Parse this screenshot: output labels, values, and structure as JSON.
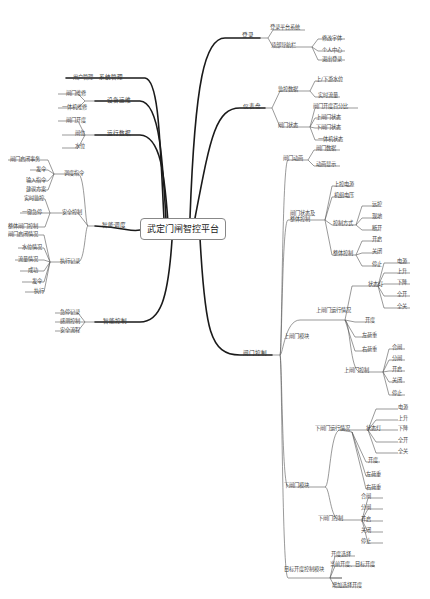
{
  "center": "武定门闸智控平台",
  "left": [
    {
      "label": "系统管理",
      "children": [
        "用户管理"
      ]
    },
    {
      "label": "设备运维",
      "children": [
        "闸门维修",
        "一体机维修"
      ]
    },
    {
      "label": "运行数据",
      "children": [
        "闸门开度",
        "闸位",
        "水位"
      ]
    },
    {
      "label": "智能调度",
      "children": [
        {
          "label": "调度指令",
          "children": [
            "闸门启闭事务",
            "发令",
            "输入指令",
            "建议方案"
          ]
        },
        {
          "label": "安全控制",
          "children": [
            "实时监控",
            "一键急停",
            "整体闸门控制"
          ]
        },
        {
          "label": "执行记录",
          "children": [
            "闸门启闭情况",
            "水位情况",
            "流量情况",
            "成功",
            "发令",
            "执行"
          ]
        }
      ]
    },
    {
      "label": "智能控制",
      "children": [
        "急停记录",
        "感测控制",
        "安全流程"
      ]
    }
  ],
  "right": [
    {
      "label": "登录",
      "children": [
        "登录平台系统",
        {
          "label": "顶部导航栏",
          "children": [
            "修改字体",
            "个人中心",
            "退出登录"
          ]
        }
      ]
    },
    {
      "label": "仪表盘",
      "children": [
        {
          "label": "监控数据",
          "children": [
            "上/下游水位",
            "实时流量"
          ]
        },
        {
          "label": "闸门状态",
          "children": [
            "闸门开度百分比",
            "上闸门状态",
            "下闸门状态",
            "一体机状态"
          ]
        }
      ]
    },
    {
      "label": "闸门控制",
      "children": [
        {
          "label": "闸门动画",
          "children": [
            "闸门数据",
            "动画显示"
          ]
        },
        {
          "label": "闸门状态及整体控制",
          "children": [
            "上控电源",
            "机组电压",
            {
              "label": "控制方式",
              "children": [
                "远控",
                "现地",
                "断开"
              ]
            },
            {
              "label": "整体控制",
              "children": [
                "开启",
                "关闭",
                "停止"
              ]
            }
          ]
        },
        {
          "label": "上闸门模块",
          "children": [
            {
              "label": "上闸门运行情况",
              "children": [
                {
                  "label": "状态灯",
                  "children": [
                    "电源",
                    "上升",
                    "下降",
                    "全开",
                    "全关"
                  ]
                },
                "开度",
                "左荷重",
                "右荷重"
              ]
            },
            {
              "label": "上闸门控制",
              "children": [
                "合闸",
                "分闸",
                "开启",
                "关闭",
                "停止"
              ]
            }
          ]
        },
        {
          "label": "下闸门模块",
          "children": [
            {
              "label": "下闸门运行情况",
              "children": [
                {
                  "label": "状态灯",
                  "children": [
                    "电源",
                    "上升",
                    "下降",
                    "全开",
                    "全关"
                  ]
                },
                "开度",
                "左荷重",
                "右荷重"
              ]
            },
            {
              "label": "下闸门控制",
              "children": [
                "合闸",
                "分闸",
                "开启",
                "关闭",
                "停止"
              ]
            }
          ]
        },
        {
          "label": "目标开度控制模块",
          "children": [
            "开度选择",
            "当前开度、目标开度",
            "增加选择开度"
          ]
        }
      ]
    }
  ],
  "labels": {
    "L0": "系统管理",
    "L0a": "用户管理",
    "L1": "设备运维",
    "L1a": "闸门维修",
    "L1b": "一体机维修",
    "L2": "运行数据",
    "L2a": "闸门开度",
    "L2b": "闸位",
    "L2c": "水位",
    "L3": "智能调度",
    "L3a": "调度指令",
    "L3a1": "闸门启闭事务",
    "L3a2": "发令",
    "L3a3": "输入指令",
    "L3a4": "建议方案",
    "L3b": "安全控制",
    "L3b1": "实时监控",
    "L3b2": "一键急停",
    "L3b3": "整体闸门控制",
    "L3c": "执行记录",
    "L3c1": "闸门启闭情况",
    "L3c2": "水位情况",
    "L3c3": "流量情况",
    "L3c4": "成功",
    "L3c5": "发令",
    "L3c6": "执行",
    "L4": "智能控制",
    "L4a": "急停记录",
    "L4b": "感测控制",
    "L4c": "安全流程",
    "R0": "登录",
    "R0a": "登录平台系统",
    "R0b": "顶部导航栏",
    "R0b1": "修改字体",
    "R0b2": "个人中心",
    "R0b3": "退出登录",
    "R1": "仪表盘",
    "R1a": "监控数据",
    "R1a1": "上/下游水位",
    "R1a2": "实时流量",
    "R1b": "闸门状态",
    "R1b1": "闸门开度百分比",
    "R1b2": "上闸门状态",
    "R1b3": "下闸门状态",
    "R1b4": "一体机状态",
    "R2": "闸门控制",
    "R2a": "闸门动画",
    "R2a1": "闸门数据",
    "R2a2": "动画显示",
    "R2b": "闸门状态及",
    "R2b_2": "整体控制",
    "R2b1": "上控电源",
    "R2b2": "机组电压",
    "R2b3": "控制方式",
    "R2b3a": "远控",
    "R2b3b": "现地",
    "R2b3c": "断开",
    "R2b4": "整体控制",
    "R2b4a": "开启",
    "R2b4b": "关闭",
    "R2b4c": "停止",
    "R2c": "上闸门模块",
    "R2c1": "上闸门运行情况",
    "R2c1s": "状态灯",
    "R2c1s1": "电源",
    "R2c1s2": "上升",
    "R2c1s3": "下降",
    "R2c1s4": "全开",
    "R2c1s5": "全关",
    "R2c1b": "开度",
    "R2c1c": "左荷重",
    "R2c1d": "右荷重",
    "R2c2": "上闸门控制",
    "R2c2a": "合闸",
    "R2c2b": "分闸",
    "R2c2c": "开启",
    "R2c2d": "关闭",
    "R2c2e": "停止",
    "R2d": "下闸门模块",
    "R2d1": "下闸门运行情况",
    "R2d1s": "状态灯",
    "R2d1s1": "电源",
    "R2d1s2": "上升",
    "R2d1s3": "下降",
    "R2d1s4": "全开",
    "R2d1s5": "全关",
    "R2d1b": "开度",
    "R2d1c": "左荷重",
    "R2d1d": "右荷重",
    "R2d2": "下闸门控制",
    "R2d2a": "合闸",
    "R2d2b": "分闸",
    "R2d2c": "开启",
    "R2d2d": "关闭",
    "R2d2e": "停止",
    "R2e": "目标开度控制模块",
    "R2e1": "开度选择",
    "R2e2": "当前开度、目标开度",
    "R2e3": "增加选择开度"
  },
  "colors": {
    "line": "#1a1a1a",
    "thin": "#555555"
  }
}
